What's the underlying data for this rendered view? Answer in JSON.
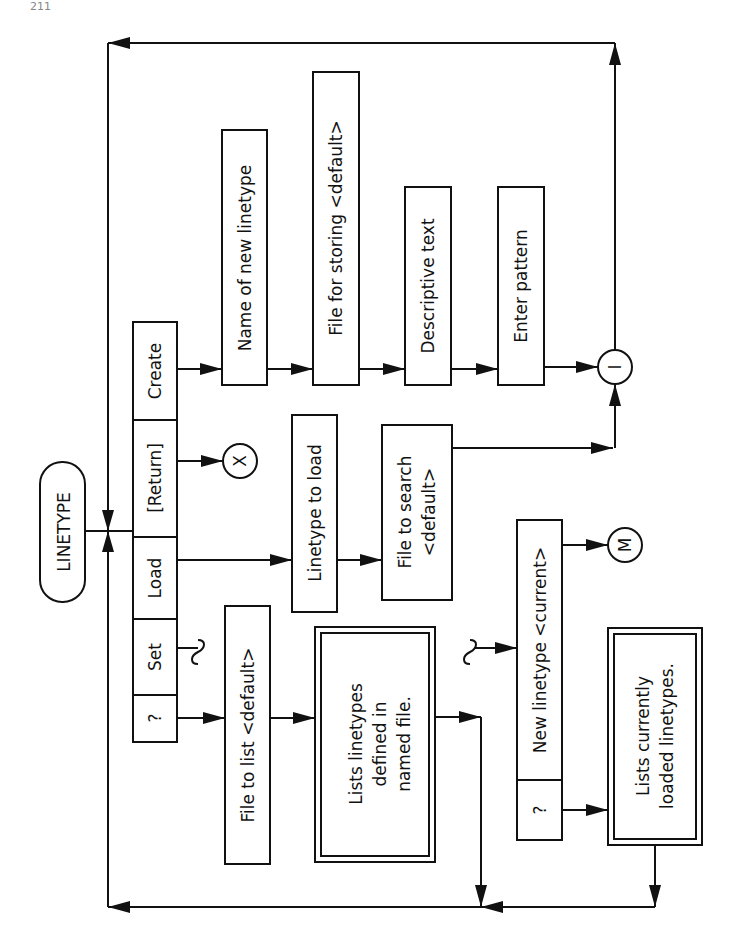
{
  "page_number": "211",
  "diagram": {
    "title": "LINETYPE",
    "options": [
      {
        "id": "create",
        "label": "Create"
      },
      {
        "id": "return",
        "label": "[Return]"
      },
      {
        "id": "load",
        "label": "Load"
      },
      {
        "id": "set",
        "label": "Set"
      },
      {
        "id": "query",
        "label": "?"
      }
    ],
    "create_flow": [
      {
        "label": "Name of new linetype"
      },
      {
        "label": "File for storing <default>"
      },
      {
        "label": "Descriptive text"
      },
      {
        "label": "Enter pattern"
      }
    ],
    "load_flow": [
      {
        "label": "Linetype to load"
      },
      {
        "label_line1": "File to search",
        "label_line2": "<default>"
      }
    ],
    "query_flow": {
      "prompt": "File to list <default>",
      "result_line1": "Lists linetypes",
      "result_line2": "defined in",
      "result_line3": "named file."
    },
    "set_flow": {
      "prompt": "New linetype <current>",
      "query_option": "?",
      "result_line1": "Lists currently",
      "result_line2": "loaded linetypes."
    },
    "connectors": {
      "exit": "X",
      "join": "I",
      "menu": "M"
    }
  }
}
